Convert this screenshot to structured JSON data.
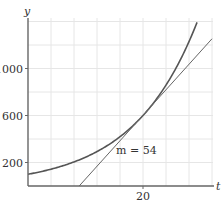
{
  "chart_data": {
    "type": "line",
    "title": "",
    "xlabel": "t",
    "ylabel": "y",
    "xlim": [
      0,
      32
    ],
    "ylim": [
      0,
      1400
    ],
    "x_ticks": [
      20
    ],
    "x_tick_labels": [
      "20"
    ],
    "y_ticks": [
      200,
      600,
      1000
    ],
    "y_tick_labels": [
      "200",
      "600",
      "1000"
    ],
    "grid": true,
    "grid_x_step": 4,
    "grid_y_step": 200,
    "series": [
      {
        "name": "exponential curve",
        "kind": "curve",
        "formula": "y = 100 * 6^(t/20)",
        "x": [
          0,
          4,
          8,
          12,
          16,
          20,
          24,
          28,
          29.4
        ],
        "values": [
          100,
          143,
          205,
          293,
          420,
          600,
          859,
          1229,
          1396
        ]
      },
      {
        "name": "tangent line at t=20",
        "kind": "line",
        "slope": 54,
        "point": [
          20,
          600
        ],
        "x": [
          8.9,
          32
        ],
        "values": [
          0,
          1253
        ]
      }
    ],
    "annotations": [
      {
        "text": "m = 54",
        "x": 15.5,
        "y": 300
      }
    ]
  },
  "labels": {
    "y_axis": "y",
    "x_axis": "t",
    "y_ticks": [
      "200",
      "600",
      "1000"
    ],
    "x_ticks": [
      "20"
    ],
    "slope": "m = 54"
  },
  "colors": {
    "curve": "#555555",
    "tangent": "#666666",
    "axis": "#666666",
    "grid": "#e6e6e6",
    "text": "#333333"
  }
}
